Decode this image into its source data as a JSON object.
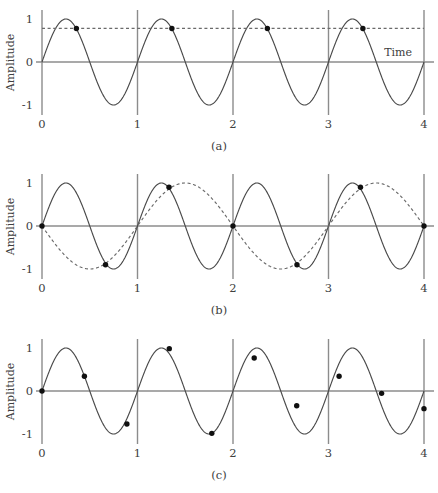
{
  "figure": {
    "title": "",
    "background_color": "#ffffff",
    "width": 438,
    "height": 493
  },
  "style": {
    "curve_color": "#4a4a4a",
    "dashed_color": "#6a6a6a",
    "grid_color": "#8c8c8c",
    "axis_color": "#8c8c8c",
    "sample_color": "#101010",
    "text_color": "#404040"
  },
  "axis": {
    "xlabel": "Time",
    "ylabel": "Amplitude",
    "xticks": [
      "0",
      "1",
      "2",
      "3",
      "4"
    ],
    "xtick_values": [
      0,
      1,
      2,
      3,
      4
    ],
    "yticks": [
      "1",
      "0",
      "-1"
    ],
    "ytick_values": [
      1,
      0,
      -1
    ],
    "xlim": [
      0,
      4
    ],
    "ylim": [
      -1.15,
      1.15
    ],
    "grid": "vertical-only-at-integers"
  },
  "captions": {
    "a": "(a)",
    "b": "(b)",
    "c": "(c)"
  },
  "chart_data": [
    {
      "id": "a",
      "type": "line",
      "title": "(a)",
      "xlabel": "Time",
      "ylabel": "Amplitude",
      "xlim": [
        0,
        4
      ],
      "ylim": [
        -1.15,
        1.15
      ],
      "grid": true,
      "legend": "none",
      "series": [
        {
          "name": "signal",
          "style": "solid",
          "kind": "sine",
          "amplitude": 1,
          "frequency": 1,
          "phase": 0,
          "description": "sin(2*pi*t), 4 cycles over t=0..4"
        },
        {
          "name": "sample-level",
          "style": "dashed-horizontal",
          "kind": "constant",
          "value": 0.78,
          "description": "horizontal dashed line through all sample amplitudes"
        }
      ],
      "samples": {
        "name": "samples",
        "interval": 1.0,
        "x": [
          0.36,
          1.36,
          2.36,
          3.36
        ],
        "y": [
          0.78,
          0.78,
          0.78,
          0.78
        ]
      }
    },
    {
      "id": "b",
      "type": "line",
      "title": "(b)",
      "xlabel": "Time",
      "ylabel": "Amplitude",
      "xlim": [
        0,
        4
      ],
      "ylim": [
        -1.15,
        1.15
      ],
      "grid": true,
      "legend": "none",
      "series": [
        {
          "name": "signal",
          "style": "solid",
          "kind": "sine",
          "amplitude": 1,
          "frequency": 1,
          "phase": 0,
          "description": "sin(2*pi*t), 4 cycles over t=0..4"
        },
        {
          "name": "alias",
          "style": "dashed",
          "kind": "sine",
          "amplitude": 1,
          "frequency": 0.5,
          "phase": 3.141592653589793,
          "description": "aliased reconstruction -sin(pi*t), 2 cycles over t=0..4"
        }
      ],
      "samples": {
        "name": "samples",
        "interval": 0.667,
        "x": [
          0,
          0.665,
          1.33,
          2.0,
          2.67,
          3.335,
          4.0
        ],
        "y": [
          0,
          -0.9,
          0.9,
          0,
          -0.9,
          0.9,
          0
        ]
      }
    },
    {
      "id": "c",
      "type": "line",
      "title": "(c)",
      "xlabel": "Time",
      "ylabel": "Amplitude",
      "xlim": [
        0,
        4
      ],
      "ylim": [
        -1.15,
        1.15
      ],
      "grid": true,
      "legend": "none",
      "series": [
        {
          "name": "signal",
          "style": "solid",
          "kind": "sine",
          "amplitude": 1,
          "frequency": 1,
          "phase": 0,
          "description": "sin(2*pi*t), 4 cycles over t=0..4"
        }
      ],
      "samples": {
        "name": "samples",
        "interval": 0.4444,
        "x": [
          0,
          0.444,
          0.889,
          1.333,
          1.778,
          2.222,
          2.667,
          3.111,
          3.556,
          4.0
        ],
        "y": [
          0,
          0.342,
          -0.766,
          0.985,
          -0.985,
          0.766,
          -0.342,
          0.342,
          -0.055,
          -0.41
        ]
      }
    }
  ]
}
